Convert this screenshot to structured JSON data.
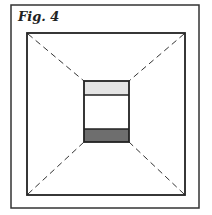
{
  "figure": {
    "caption": "Fig. 4",
    "colors": {
      "line": "#222222",
      "top_band": "#e4e4e4",
      "bottom_band": "#6e6e6e",
      "background": "#ffffff"
    }
  }
}
